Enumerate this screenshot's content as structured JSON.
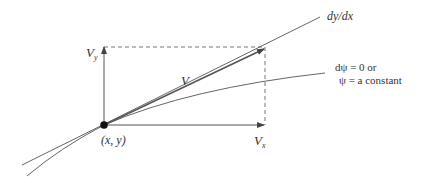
{
  "diagram": {
    "labels": {
      "vy": "V",
      "vy_sub": "y",
      "v": "V",
      "point": "(x, y)",
      "vx": "V",
      "vx_sub": "x",
      "slope": "dy/dx",
      "streamline_line1": "dψ = 0 or",
      "streamline_line2": "ψ = a constant"
    },
    "colors": {
      "line": "#555555",
      "dashed": "#777777",
      "point": "#111111",
      "text": "#333333"
    },
    "geometry": {
      "origin": [
        104,
        125
      ],
      "vy_tip": [
        104,
        47
      ],
      "vx_tip": [
        263,
        125
      ],
      "v_tip": [
        265,
        48
      ],
      "tangent_start": [
        22,
        165
      ],
      "tangent_end": [
        320,
        17
      ]
    }
  }
}
